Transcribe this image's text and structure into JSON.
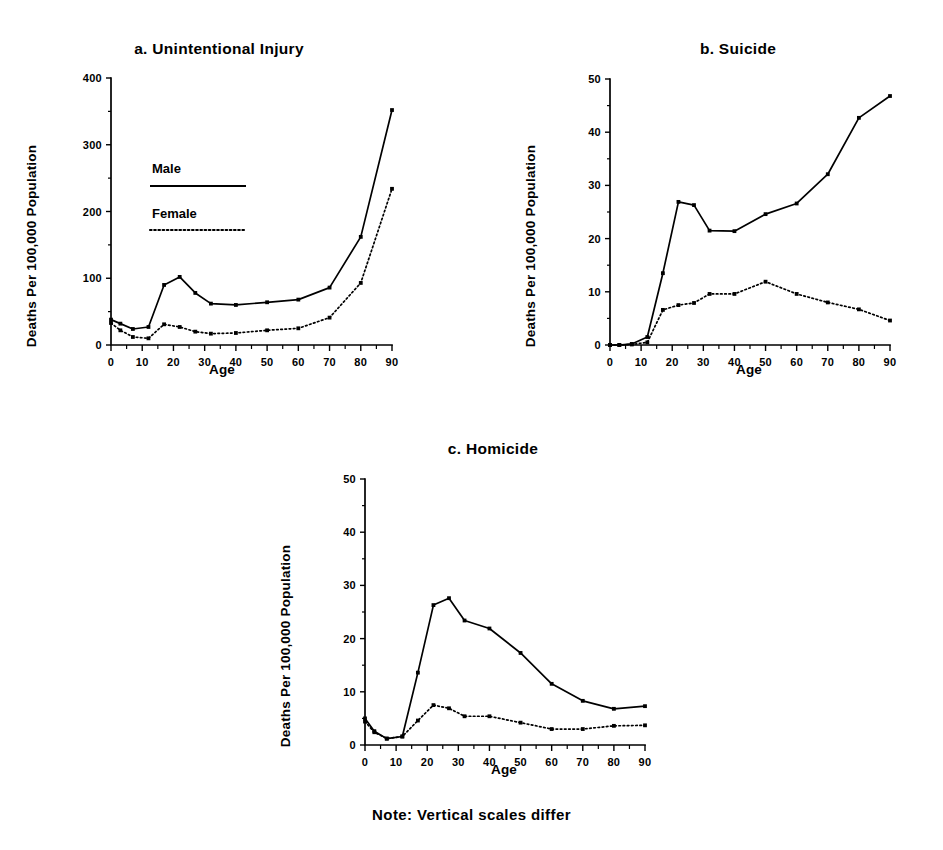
{
  "figure": {
    "note": "Note: Vertical scales differ",
    "ink_color": "#000000",
    "background": "#ffffff"
  },
  "legend": {
    "male_label": "Male",
    "female_label": "Female"
  },
  "chart_data": [
    {
      "type": "line",
      "panel": "a",
      "panel_label": "a.",
      "title": "a.   Unintentional Injury",
      "title_text": "Unintentional Injury",
      "xlabel": "Age",
      "ylabel": "Deaths Per 100,000 Population",
      "xlim": [
        0,
        90
      ],
      "ylim": [
        0,
        400
      ],
      "xticks": [
        0,
        10,
        20,
        30,
        40,
        50,
        60,
        70,
        80,
        90
      ],
      "yticks": [
        0,
        100,
        200,
        300,
        400
      ],
      "xtick_labels": [
        "0",
        "10",
        "20",
        "30",
        "40",
        "50",
        "60",
        "70",
        "80",
        "90"
      ],
      "ytick_labels": [
        "0",
        "100",
        "200",
        "300",
        "400"
      ],
      "grid": false,
      "legend_position": "inside-upper-left",
      "x": [
        0,
        3,
        7,
        12,
        17,
        22,
        27,
        32,
        40,
        50,
        60,
        70,
        80,
        90
      ],
      "series": [
        {
          "name": "Male",
          "style": "solid",
          "values": [
            38,
            32,
            24,
            27,
            90,
            102,
            78,
            62,
            60,
            64,
            68,
            86,
            162,
            352
          ]
        },
        {
          "name": "Female",
          "style": "dotted",
          "values": [
            33,
            22,
            12,
            10,
            31,
            27,
            20,
            17,
            18,
            22,
            25,
            41,
            93,
            234
          ]
        }
      ]
    },
    {
      "type": "line",
      "panel": "b",
      "panel_label": "b.",
      "title": "b.   Suicide",
      "title_text": "Suicide",
      "xlabel": "Age",
      "ylabel": "Deaths Per 100,000 Population",
      "xlim": [
        0,
        90
      ],
      "ylim": [
        0,
        50
      ],
      "xticks": [
        0,
        10,
        20,
        30,
        40,
        50,
        60,
        70,
        80,
        90
      ],
      "yticks": [
        0,
        10,
        20,
        30,
        40,
        50
      ],
      "xtick_labels": [
        "0",
        "10",
        "20",
        "30",
        "40",
        "50",
        "60",
        "70",
        "80",
        "90"
      ],
      "ytick_labels": [
        "0",
        "10",
        "20",
        "30",
        "40",
        "50"
      ],
      "grid": false,
      "legend_position": "none",
      "x": [
        0,
        3,
        7,
        12,
        17,
        22,
        27,
        32,
        40,
        50,
        60,
        70,
        80,
        90
      ],
      "series": [
        {
          "name": "Male",
          "style": "solid",
          "values": [
            0,
            0,
            0.2,
            1.5,
            13.5,
            26.9,
            26.3,
            21.5,
            21.4,
            24.6,
            26.6,
            32.1,
            42.7,
            46.8
          ]
        },
        {
          "name": "Female",
          "style": "dotted",
          "values": [
            0,
            0,
            0.1,
            0.5,
            6.6,
            7.5,
            7.9,
            9.6,
            9.6,
            11.9,
            9.6,
            8.0,
            6.7,
            4.6
          ]
        }
      ]
    },
    {
      "type": "line",
      "panel": "c",
      "panel_label": "c.",
      "title": "c.   Homicide",
      "title_text": "Homicide",
      "xlabel": "Age",
      "ylabel": "Deaths Per 100,000 Population",
      "xlim": [
        0,
        90
      ],
      "ylim": [
        0,
        50
      ],
      "xticks": [
        0,
        10,
        20,
        30,
        40,
        50,
        60,
        70,
        80,
        90
      ],
      "yticks": [
        0,
        10,
        20,
        30,
        40,
        50
      ],
      "xtick_labels": [
        "0",
        "10",
        "20",
        "30",
        "40",
        "50",
        "60",
        "70",
        "80",
        "90"
      ],
      "ytick_labels": [
        "0",
        "10",
        "20",
        "30",
        "40",
        "50"
      ],
      "grid": false,
      "legend_position": "none",
      "x": [
        0,
        3,
        7,
        12,
        17,
        22,
        27,
        32,
        40,
        50,
        60,
        70,
        80,
        90
      ],
      "series": [
        {
          "name": "Male",
          "style": "solid",
          "values": [
            5.0,
            2.6,
            1.2,
            1.6,
            13.6,
            26.3,
            27.6,
            23.4,
            21.9,
            17.3,
            11.5,
            8.3,
            6.8,
            7.3
          ]
        },
        {
          "name": "Female",
          "style": "dotted",
          "values": [
            4.4,
            2.4,
            1.2,
            1.6,
            4.6,
            7.5,
            6.9,
            5.4,
            5.4,
            4.2,
            3.0,
            3.0,
            3.6,
            3.7
          ]
        }
      ]
    }
  ]
}
